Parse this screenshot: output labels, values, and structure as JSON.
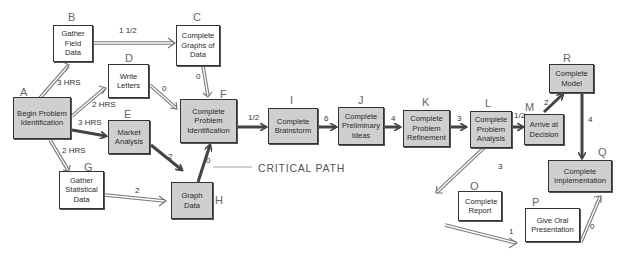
{
  "diagram": {
    "type": "critical-path-network",
    "annotation": "CRITICAL PATH",
    "colors": {
      "critical_fill": "#cfcfcf",
      "normal_fill": "#ffffff",
      "critical_arrow": "#444444",
      "normal_arrow": "#777777"
    },
    "nodes": [
      {
        "id": "A",
        "label": "Begin Problem Identification",
        "critical": true
      },
      {
        "id": "B",
        "label": "Gather Field Data",
        "critical": false
      },
      {
        "id": "C",
        "label": "Complete Graphs of Data",
        "critical": false
      },
      {
        "id": "D",
        "label": "Write Letters",
        "critical": false
      },
      {
        "id": "E",
        "label": "Market Analysis",
        "critical": true
      },
      {
        "id": "F",
        "label": "Complete Problem Identification",
        "critical": true
      },
      {
        "id": "G",
        "label": "Gather Statistical Data",
        "critical": false
      },
      {
        "id": "H",
        "label": "Graph Data",
        "critical": true
      },
      {
        "id": "I",
        "label": "Complete Brainstorm",
        "critical": true
      },
      {
        "id": "J",
        "label": "Complete Preliminary Ideas",
        "critical": true
      },
      {
        "id": "K",
        "label": "Complete Problem Refinement",
        "critical": true
      },
      {
        "id": "L",
        "label": "Complete Problem Analysis",
        "critical": true
      },
      {
        "id": "M",
        "label": "Arrive at Decision",
        "critical": true
      },
      {
        "id": "O",
        "label": "Complete Report",
        "critical": false
      },
      {
        "id": "P",
        "label": "Give Oral Presentation",
        "critical": false
      },
      {
        "id": "Q",
        "label": "Complete Implementation",
        "critical": true
      },
      {
        "id": "R",
        "label": "Complete Model",
        "critical": true
      }
    ],
    "edges": [
      {
        "from": "A",
        "to": "B",
        "label": "3 HRS",
        "critical": false
      },
      {
        "from": "A",
        "to": "D",
        "label": "2 HRS",
        "critical": false
      },
      {
        "from": "A",
        "to": "E",
        "label": "3 HRS",
        "critical": true
      },
      {
        "from": "A",
        "to": "G",
        "label": "2 HRS",
        "critical": false
      },
      {
        "from": "B",
        "to": "C",
        "label": "1 1/2",
        "critical": false
      },
      {
        "from": "C",
        "to": "F",
        "label": "0",
        "critical": false
      },
      {
        "from": "D",
        "to": "F",
        "label": "0",
        "critical": false
      },
      {
        "from": "E",
        "to": "H",
        "label": "2",
        "critical": true
      },
      {
        "from": "G",
        "to": "H",
        "label": "2",
        "critical": false
      },
      {
        "from": "H",
        "to": "F",
        "label": "0",
        "critical": true
      },
      {
        "from": "F",
        "to": "I",
        "label": "1/2",
        "critical": true
      },
      {
        "from": "I",
        "to": "J",
        "label": "6",
        "critical": true
      },
      {
        "from": "J",
        "to": "K",
        "label": "4",
        "critical": true
      },
      {
        "from": "K",
        "to": "L",
        "label": "3",
        "critical": true
      },
      {
        "from": "L",
        "to": "M",
        "label": "1/2",
        "critical": true
      },
      {
        "from": "M",
        "to": "R",
        "label": "2",
        "critical": true
      },
      {
        "from": "R",
        "to": "Q",
        "label": "4",
        "critical": true
      },
      {
        "from": "M",
        "to": "O",
        "label": "3",
        "critical": false
      },
      {
        "from": "O",
        "to": "P",
        "label": "1",
        "critical": false
      },
      {
        "from": "P",
        "to": "Q",
        "label": "0",
        "critical": false
      }
    ]
  }
}
